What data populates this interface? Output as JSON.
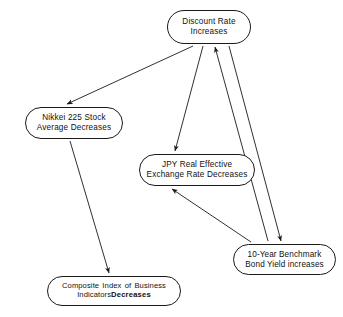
{
  "diagram": {
    "type": "directed-graph",
    "background_color": "#ffffff",
    "stroke_color": "#1a1a1a",
    "text_color": "#111111",
    "nodes": [
      {
        "id": "discount_rate",
        "line1": "Discount Rate",
        "line2": "Increases"
      },
      {
        "id": "nikkei",
        "line1": "Nikkei 225 Stock",
        "line2": "Average Decreases"
      },
      {
        "id": "jpy",
        "line1": "JPY Real Effective",
        "line2": "Exchange Rate Decreases"
      },
      {
        "id": "bond",
        "line1": "10-Year Benchmark",
        "line2": "Bond Yield increases"
      },
      {
        "id": "composite",
        "line1": "Composite Index of Business",
        "line2_normal": "Indicators",
        "line2_bold": "Decreases"
      }
    ],
    "edges": [
      {
        "id": "discount-to-nikkei",
        "from": "Discount Rate Increases",
        "to": "Nikkei 225 Stock Average Decreases"
      },
      {
        "id": "discount-to-jpy",
        "from": "Discount Rate Increases",
        "to": "JPY Real Effective Exchange Rate Decreases"
      },
      {
        "id": "discount-to-bond",
        "from": "Discount Rate Increases",
        "to": "10-Year Benchmark Bond Yield increases"
      },
      {
        "id": "bond-to-discount",
        "from": "10-Year Benchmark Bond Yield increases",
        "to": "Discount Rate Increases"
      },
      {
        "id": "bond-to-jpy",
        "from": "10-Year Benchmark Bond Yield increases",
        "to": "JPY Real Effective Exchange Rate Decreases"
      },
      {
        "id": "nikkei-to-composite",
        "from": "Nikkei 225 Stock Average Decreases",
        "to": "Composite Index of Business Indicators Decreases"
      }
    ]
  }
}
